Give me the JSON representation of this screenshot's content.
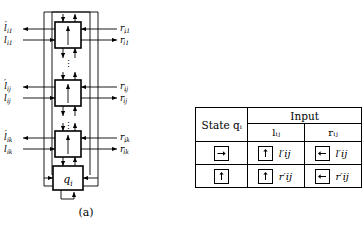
{
  "figure": {
    "panel_a": {
      "caption": "(a)",
      "state_box_label": "qᵢ",
      "rows": [
        {
          "id": "row-1",
          "left_out": "l′i1",
          "left_in": "li1",
          "right_in": "ri1",
          "right_out": "r′i1",
          "cell_glyph": "up-arrow-box"
        },
        {
          "id": "row-j",
          "left_out": "l′ij",
          "left_in": "lij",
          "right_in": "rij",
          "right_out": "r′ij",
          "cell_glyph": "up-arrow-box"
        },
        {
          "id": "row-k",
          "left_out": "l′ik",
          "left_in": "lik",
          "right_in": "rik",
          "right_out": "r′ik",
          "cell_glyph": "up-arrow-box"
        }
      ],
      "vertical_dots": [
        "⋮",
        "⋮"
      ]
    },
    "panel_b": {
      "caption": "(b)",
      "table": {
        "header_state": "State qᵢ",
        "header_input": "Input",
        "header_cols": [
          "lᵢⱼ",
          "rᵢⱼ"
        ],
        "rows": [
          {
            "state_glyph": "right-arrow-box",
            "cells": [
              {
                "glyph": "up-arrow-box",
                "label": "l′ij"
              },
              {
                "glyph": "left-arrow-box",
                "label": "l′ij"
              }
            ]
          },
          {
            "state_glyph": "up-arrow-box",
            "cells": [
              {
                "glyph": "up-arrow-box",
                "label": "r′ij"
              },
              {
                "glyph": "left-arrow-box",
                "label": "r′ij"
              }
            ]
          }
        ]
      }
    }
  },
  "colors": {
    "ink": "#000000",
    "background": "#ffffff"
  }
}
